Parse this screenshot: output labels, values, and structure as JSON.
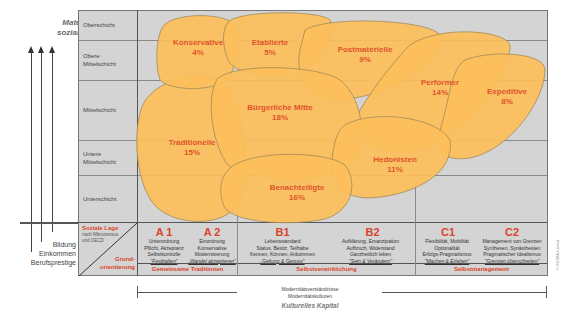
{
  "left_axis": {
    "title_line1": "Materielles &",
    "title_line2": "soziales Kapital",
    "labels": [
      "Bildung",
      "Einkommen",
      "Berufsprestige"
    ]
  },
  "rows": [
    {
      "label_line1": "Oberschicht",
      "label_line2": ""
    },
    {
      "label_line1": "Obere",
      "label_line2": "Mittelschicht"
    },
    {
      "label_line1": "Mittelschicht",
      "label_line2": ""
    },
    {
      "label_line1": "Untere",
      "label_line2": "Mittelschicht"
    },
    {
      "label_line1": "Unterschicht",
      "label_line2": ""
    }
  ],
  "corner_cell": {
    "soziale_lage": "Soziale Lage",
    "soziale_lage_sub1": "nach Mikrozensus",
    "soziale_lage_sub2": "und OECD",
    "grund1": "Grund-",
    "grund2": "orientierung"
  },
  "columns": [
    {
      "id": "A1",
      "lines": [
        "Unterordnung",
        "Pflicht, Akzeptanz",
        "Selbstkontrolle"
      ],
      "motto": "\"Festhalten\""
    },
    {
      "id": "A 2",
      "lines": [
        "Einordnung",
        "Konservative",
        "Modernisierung"
      ],
      "motto": "„Wandel akzeptieren\""
    },
    {
      "id": "B1",
      "lines": [
        "Lebensstandard",
        "Status, Besitz, Teilhabe",
        "Kennen, Können, Ankommen"
      ],
      "motto": "„Geltung & Genuss\""
    },
    {
      "id": "B2",
      "lines": [
        "Aufklärung, Emanzipation",
        "Aufbruch, Widerstand",
        "Ganzheitlich leben"
      ],
      "motto": "\"Sein & Verändern\""
    },
    {
      "id": "C1",
      "lines": [
        "Flexibilität, Mobilität",
        "Optionalität",
        "Erfolgs-Pragmatismus"
      ],
      "motto": "\"Machen & Erleben\""
    },
    {
      "id": "C2",
      "lines": [
        "Management von Grenzen",
        "Synthesen, Synästhesien",
        "Pragmatischer Idealismus"
      ],
      "motto": "\"Grenzen überschreiten\""
    }
  ],
  "column_heads": {
    "a1": "A 1",
    "a2": "A 2",
    "b1": "B1",
    "b2": "B2",
    "c1": "C1",
    "c2": "C2"
  },
  "groups": [
    "Gemeinsame Traditionen",
    "Selbstverwirklichung",
    "Selbstmanagement"
  ],
  "milieus": [
    {
      "name": "Konservative",
      "share": "4%"
    },
    {
      "name": "Etablierte",
      "share": "5%"
    },
    {
      "name": "Postmaterielle",
      "share": "9%"
    },
    {
      "name": "Performer",
      "share": "14%"
    },
    {
      "name": "Expeditive",
      "share": "8%"
    },
    {
      "name": "Bürgerliche Mitte",
      "share": "18%"
    },
    {
      "name": "Traditionelle",
      "share": "15%"
    },
    {
      "name": "Hedonisten",
      "share": "11%"
    },
    {
      "name": "Benachteiligte",
      "share": "16%"
    }
  ],
  "bottom_axis": {
    "line1": "Modernitätsverständnisse",
    "line2": "Modernitätskulturen",
    "title": "Kulturelles Kapital"
  },
  "copyright": "© SIGMA-Institut",
  "colors": {
    "blob_fill": "#fdbf5a",
    "blob_overlap": "#fbb030",
    "blob_stroke": "#a08a5a",
    "label_red": "#e0532a",
    "grid_bg": "#d4d4d4"
  }
}
